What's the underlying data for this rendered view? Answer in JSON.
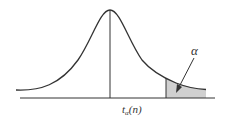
{
  "diagram": {
    "type": "t-distribution density curve with upper-tail critical region",
    "critical_value_label": {
      "base": "t",
      "subscript": "α",
      "argument": "(n)"
    },
    "tail_area_label": "α",
    "colors": {
      "curve": "#333333",
      "axis": "#333333",
      "shaded_region": "#d0d0d0",
      "background": "#ffffff"
    }
  }
}
